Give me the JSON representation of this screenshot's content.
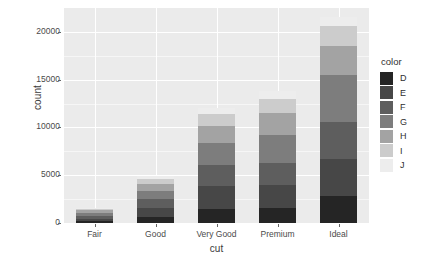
{
  "chart_data": {
    "type": "bar",
    "barmode": "stacked",
    "title": "",
    "xlabel": "cut",
    "ylabel": "count",
    "categories": [
      "Fair",
      "Good",
      "Very Good",
      "Premium",
      "Ideal"
    ],
    "ylim": [
      0,
      22500
    ],
    "yticks": [
      0,
      5000,
      10000,
      15000,
      20000
    ],
    "ytick_labels": [
      "0",
      "5000",
      "10000",
      "15000",
      "20000"
    ],
    "grid": true,
    "legend": {
      "title": "color",
      "position": "right",
      "entries": [
        "D",
        "E",
        "F",
        "G",
        "H",
        "I",
        "J"
      ]
    },
    "series": [
      {
        "name": "D",
        "color": "#252525",
        "values": [
          163,
          662,
          1513,
          1603,
          2834
        ]
      },
      {
        "name": "E",
        "color": "#474747",
        "values": [
          224,
          933,
          2400,
          2337,
          3903
        ]
      },
      {
        "name": "F",
        "color": "#5e5e5e",
        "values": [
          312,
          909,
          2164,
          2331,
          3826
        ]
      },
      {
        "name": "G",
        "color": "#7d7d7d",
        "values": [
          314,
          871,
          2299,
          2924,
          4884
        ]
      },
      {
        "name": "H",
        "color": "#a3a3a3",
        "values": [
          303,
          702,
          1824,
          2360,
          3115
        ]
      },
      {
        "name": "I",
        "color": "#cccccc",
        "values": [
          175,
          522,
          1204,
          1428,
          2093
        ]
      },
      {
        "name": "J",
        "color": "#ededed",
        "values": [
          119,
          307,
          678,
          808,
          896
        ]
      }
    ],
    "totals": [
      1610,
      4906,
      12082,
      13791,
      21551
    ]
  },
  "colors": {
    "panel_background": "#ebebeb",
    "grid_major": "#ffffff",
    "axis_text": "#4a4a4a",
    "axis_title": "#3a3a3a",
    "page_background": "#ffffff"
  }
}
